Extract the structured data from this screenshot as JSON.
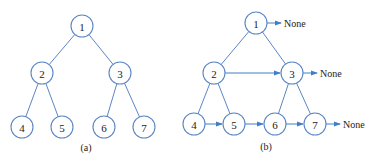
{
  "figure_a": {
    "caption": "(a)",
    "nodes": [
      {
        "id": "1",
        "label": "1",
        "x": 82,
        "y": 26
      },
      {
        "id": "2",
        "label": "2",
        "x": 42,
        "y": 73
      },
      {
        "id": "3",
        "label": "3",
        "x": 120,
        "y": 73
      },
      {
        "id": "4",
        "label": "4",
        "x": 22,
        "y": 127
      },
      {
        "id": "5",
        "label": "5",
        "x": 62,
        "y": 127
      },
      {
        "id": "6",
        "label": "6",
        "x": 104,
        "y": 127
      },
      {
        "id": "7",
        "label": "7",
        "x": 144,
        "y": 127
      }
    ],
    "edges": [
      [
        "1",
        "2"
      ],
      [
        "1",
        "3"
      ],
      [
        "2",
        "4"
      ],
      [
        "2",
        "5"
      ],
      [
        "3",
        "6"
      ],
      [
        "3",
        "7"
      ]
    ]
  },
  "figure_b": {
    "caption": "(b)",
    "none_label": "None",
    "nodes": [
      {
        "id": "1",
        "label": "1",
        "x": 256,
        "y": 23
      },
      {
        "id": "2",
        "label": "2",
        "x": 214,
        "y": 73
      },
      {
        "id": "3",
        "label": "3",
        "x": 292,
        "y": 73
      },
      {
        "id": "4",
        "label": "4",
        "x": 194,
        "y": 124
      },
      {
        "id": "5",
        "label": "5",
        "x": 234,
        "y": 124
      },
      {
        "id": "6",
        "label": "6",
        "x": 275,
        "y": 124
      },
      {
        "id": "7",
        "label": "7",
        "x": 315,
        "y": 124
      }
    ],
    "edges": [
      [
        "1",
        "2"
      ],
      [
        "1",
        "3"
      ],
      [
        "2",
        "4"
      ],
      [
        "2",
        "5"
      ],
      [
        "3",
        "6"
      ],
      [
        "3",
        "7"
      ]
    ],
    "next_pointers": [
      [
        "2",
        "3"
      ],
      [
        "4",
        "5"
      ],
      [
        "5",
        "6"
      ],
      [
        "6",
        "7"
      ]
    ],
    "none_pointers": [
      "1",
      "3",
      "7"
    ]
  },
  "colors": {
    "node_stroke": "#5b86c4",
    "arrow": "#3f7fc8"
  }
}
